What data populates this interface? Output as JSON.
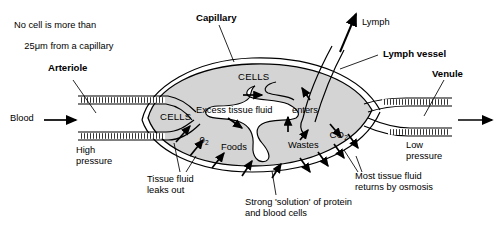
{
  "figure": {
    "type": "biology-diagram",
    "colors": {
      "background": "#ffffff",
      "ink": "#000000",
      "tissue_fill": "#d4d4d4",
      "vessel_fill": "#ffffff"
    }
  },
  "labels": {
    "note_line1": "No cell is more than",
    "note_line2_pre": "25",
    "note_line2_mu": "μm",
    "note_line2_post": " from a capillary",
    "arteriole": "Arteriole",
    "capillary": "Capillary",
    "lymph": "Lymph",
    "lymph_vessel": "Lymph vessel",
    "venule": "Venule",
    "blood": "Blood",
    "high_pressure_l1": "High",
    "high_pressure_l2": "pressure",
    "low_pressure_l1": "Low",
    "low_pressure_l2": "pressure",
    "cells_top": "CELLS",
    "cells_left": "CELLS",
    "oxygen_main": "0",
    "oxygen_sub": "2",
    "co2_main": "CO",
    "co2_sub": "2",
    "foods": "Foods",
    "wastes": "Wastes",
    "excess_tissue_fluid": "Excess tissue fluid",
    "enters": "enters",
    "tissue_fluid_l1": "Tissue fluid",
    "tissue_fluid_l2": "leaks out",
    "strong_solution_l1": "Strong 'solution' of protein",
    "strong_solution_l2": "and blood cells",
    "osmosis_l1": "Most tissue fluid",
    "osmosis_l2": "returns by osmosis"
  }
}
